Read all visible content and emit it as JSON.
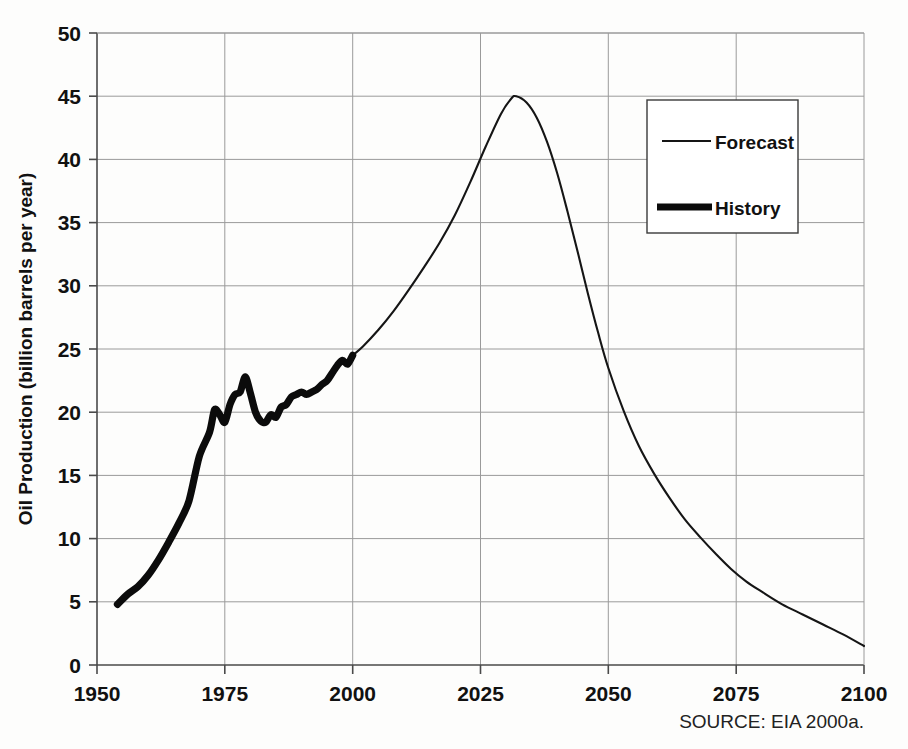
{
  "chart_data": {
    "type": "line",
    "title": "",
    "xlabel": "",
    "ylabel": "Oil Production (billion barrels per year)",
    "xlim": [
      1950,
      2100
    ],
    "ylim": [
      0,
      50
    ],
    "xticks": [
      "1950",
      "1975",
      "2000",
      "2025",
      "2050",
      "2075",
      "2100"
    ],
    "yticks": [
      "0",
      "5",
      "10",
      "15",
      "20",
      "25",
      "30",
      "35",
      "40",
      "45",
      "50"
    ],
    "grid": true,
    "legend_position": "upper-right",
    "source_note": "SOURCE: EIA 2000a.",
    "series": [
      {
        "name": "Forecast",
        "style": "thin-line",
        "color": "#151515",
        "x": [
          2000,
          2002,
          2005,
          2008,
          2011,
          2014,
          2017,
          2020,
          2023,
          2026,
          2029,
          2031,
          2032,
          2034,
          2036,
          2038,
          2040,
          2042,
          2044,
          2046,
          2048,
          2050,
          2053,
          2056,
          2059,
          2062,
          2065,
          2068,
          2071,
          2074,
          2077,
          2080,
          2084,
          2088,
          2092,
          2096,
          2100
        ],
        "values": [
          24.5,
          25.2,
          26.5,
          28.0,
          29.7,
          31.5,
          33.4,
          35.6,
          38.2,
          41.0,
          43.6,
          44.8,
          45.0,
          44.5,
          43.3,
          41.4,
          38.9,
          35.9,
          32.7,
          29.4,
          26.3,
          23.5,
          20.1,
          17.3,
          15.1,
          13.2,
          11.5,
          10.1,
          8.8,
          7.6,
          6.6,
          5.8,
          4.8,
          4.0,
          3.2,
          2.4,
          1.5
        ]
      },
      {
        "name": "History",
        "style": "thick-line",
        "color": "#0b0b0b",
        "x": [
          1954,
          1956,
          1958,
          1960,
          1962,
          1964,
          1966,
          1968,
          1970,
          1972,
          1973,
          1974,
          1975,
          1976,
          1977,
          1978,
          1979,
          1980,
          1981,
          1982,
          1983,
          1984,
          1985,
          1986,
          1987,
          1988,
          1989,
          1990,
          1991,
          1992,
          1993,
          1994,
          1995,
          1996,
          1997,
          1998,
          1999,
          2000
        ],
        "values": [
          4.8,
          5.6,
          6.2,
          7.1,
          8.3,
          9.7,
          11.2,
          13.0,
          16.5,
          18.4,
          20.2,
          19.8,
          19.2,
          20.6,
          21.4,
          21.6,
          22.8,
          21.5,
          20.0,
          19.3,
          19.2,
          19.8,
          19.6,
          20.4,
          20.6,
          21.2,
          21.4,
          21.6,
          21.4,
          21.6,
          21.8,
          22.2,
          22.5,
          23.1,
          23.7,
          24.1,
          23.8,
          24.5
        ]
      }
    ],
    "annotations": {
      "peak_year": 2032,
      "peak_value": 45.0,
      "history_start_year": 1954,
      "history_start_value": 4.8,
      "history_end_year": 2000,
      "history_end_value": 24.5,
      "forecast_end_year": 2100,
      "forecast_end_value": 1.5
    }
  },
  "legend": {
    "items": [
      {
        "label": "Forecast",
        "style": "thin"
      },
      {
        "label": "History",
        "style": "thick"
      }
    ]
  },
  "colors": {
    "line": "#151515",
    "grid": "#9a9a9a",
    "axis": "#4a4a4a",
    "background": "#fdfdfc"
  }
}
